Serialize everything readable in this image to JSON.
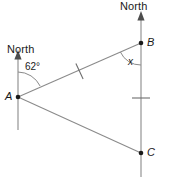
{
  "figure": {
    "type": "bearings-geometry-diagram",
    "width": 169,
    "height": 177,
    "background_color": "#ffffff",
    "line_color": "#8a8a8a",
    "text_color": "#1a1a1a"
  },
  "labels": {
    "north_left": "North",
    "north_right": "North",
    "point_a": "A",
    "point_b": "B",
    "point_c": "C",
    "angle_at_a": "62°",
    "angle_at_b": "x"
  },
  "points": {
    "a": {
      "x": 18,
      "y": 97
    },
    "b": {
      "x": 141,
      "y": 43
    },
    "c": {
      "x": 141,
      "y": 153
    }
  },
  "north_lines": [
    {
      "name": "north-line-a",
      "x": 18,
      "top": 56,
      "bottom": 130,
      "arrow": "up"
    },
    {
      "name": "north-line-b",
      "x": 141,
      "top": 17,
      "bottom": 177,
      "arrow": "up"
    }
  ],
  "segments": [
    {
      "name": "segment-ab",
      "from": "a",
      "to": "b",
      "tick_marks": 1
    },
    {
      "name": "segment-ac",
      "from": "a",
      "to": "c",
      "tick_marks": 0
    },
    {
      "name": "segment-bc",
      "from": "b",
      "to": "c",
      "tick_marks": 1
    }
  ],
  "angles": [
    {
      "name": "angle-a",
      "vertex": "a",
      "value": "62°",
      "between": [
        "north-line-a",
        "segment-ab"
      ]
    },
    {
      "name": "angle-b",
      "vertex": "b",
      "value": "x",
      "between": [
        "segment-ba",
        "north-line-b-downward"
      ]
    }
  ]
}
